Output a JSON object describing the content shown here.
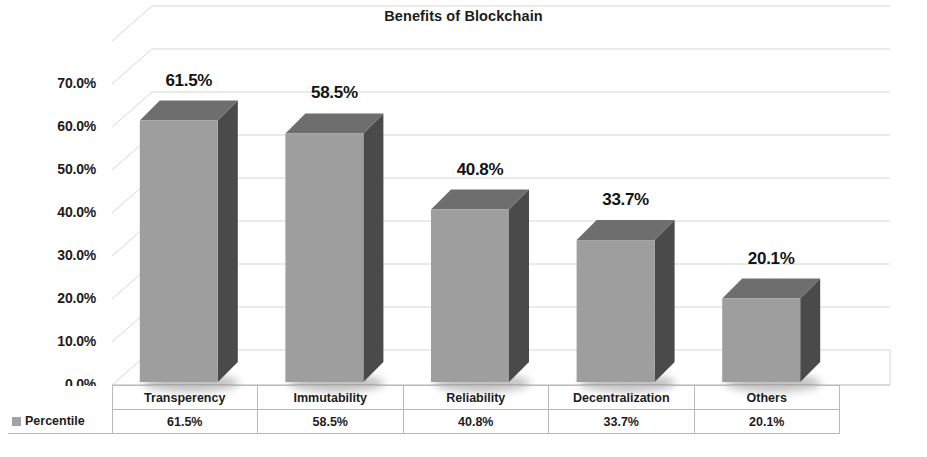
{
  "chart_data": {
    "type": "bar",
    "title": "Benefits of Blockchain",
    "xlabel": "",
    "ylabel": "",
    "categories": [
      "Transperency",
      "Immutability",
      "Reliability",
      "Decentralization",
      "Others"
    ],
    "values": [
      61.5,
      58.5,
      40.8,
      33.7,
      20.1
    ],
    "value_labels": [
      "61.5%",
      "58.5%",
      "40.8%",
      "33.7%",
      "20.1%"
    ],
    "series": [
      {
        "name": "Percentile",
        "values": [
          61.5,
          58.5,
          40.8,
          33.7,
          20.1
        ],
        "value_labels": [
          "61.5%",
          "58.5%",
          "40.8%",
          "33.7%",
          "20.1%"
        ]
      }
    ],
    "ylim": [
      0,
      70
    ],
    "ytick_values": [
      0,
      10,
      20,
      30,
      40,
      50,
      60,
      70
    ],
    "ytick_labels": [
      "0.0%",
      "10.0%",
      "20.0%",
      "30.0%",
      "40.0%",
      "50.0%",
      "60.0%",
      "70.0%"
    ],
    "grid": true,
    "legend_position": "data-table-row",
    "style": "3d-column",
    "colors": {
      "bar_front": "#9e9e9e",
      "bar_side": "#4a4a4a",
      "bar_top": "#6e6e6e",
      "gridline": "#d6d6d6",
      "background": "#ffffff",
      "text": "#1c1c1c",
      "table_border": "#b9b9b9",
      "legend_swatch": "#a3a3a3"
    }
  },
  "data_table": {
    "series_label": "Percentile",
    "headers": [
      "Transperency",
      "Immutability",
      "Reliability",
      "Decentralization",
      "Others"
    ],
    "row_values": [
      "61.5%",
      "58.5%",
      "40.8%",
      "33.7%",
      "20.1%"
    ]
  }
}
